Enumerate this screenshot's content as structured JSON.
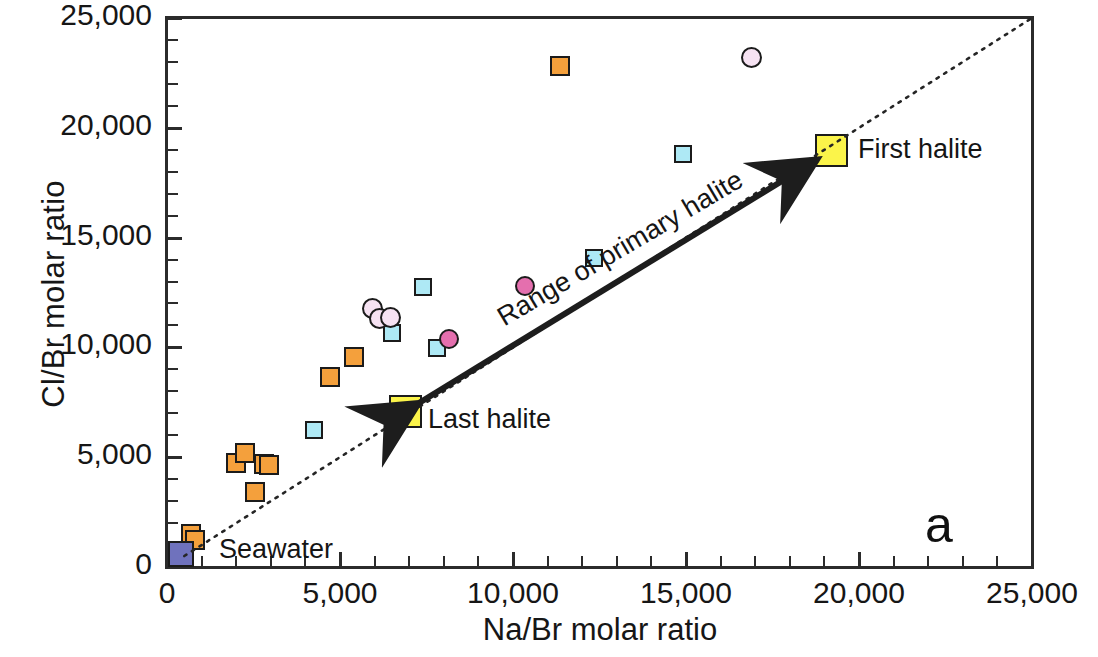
{
  "chart_data": {
    "type": "scatter",
    "title": "",
    "panel_label": "a",
    "xlabel": "Na/Br molar ratio",
    "ylabel": "Cl/Br molar ratio",
    "xlim": [
      0,
      25000
    ],
    "ylim": [
      0,
      25000
    ],
    "xticks": [
      "0",
      "5,000",
      "10,000",
      "15,000",
      "20,000",
      "25,000"
    ],
    "xtick_values": [
      0,
      5000,
      10000,
      15000,
      20000,
      25000
    ],
    "yticks": [
      "0",
      "5,000",
      "10,000",
      "15,000",
      "20,000",
      "25,000"
    ],
    "ytick_values": [
      0,
      5000,
      10000,
      15000,
      20000,
      25000
    ],
    "minor_tick_interval": 1000,
    "grid": false,
    "legend": null,
    "series": [
      {
        "name": "orange-square",
        "marker": "square",
        "fill": "#f4a03c",
        "edge": "#b5732a",
        "size": 20,
        "points": [
          {
            "x": 700,
            "y": 1500
          },
          {
            "x": 800,
            "y": 1250
          },
          {
            "x": 2000,
            "y": 4750
          },
          {
            "x": 2250,
            "y": 5200
          },
          {
            "x": 2800,
            "y": 4700
          },
          {
            "x": 2950,
            "y": 4650
          },
          {
            "x": 2550,
            "y": 3400
          },
          {
            "x": 4700,
            "y": 8650
          },
          {
            "x": 5400,
            "y": 9550
          },
          {
            "x": 11350,
            "y": 22800
          }
        ]
      },
      {
        "name": "cyan-square",
        "marker": "square",
        "fill": "#aee9f5",
        "edge": "#3e9fb8",
        "size": 18,
        "points": [
          {
            "x": 4250,
            "y": 6250
          },
          {
            "x": 6500,
            "y": 10650
          },
          {
            "x": 7800,
            "y": 9950
          },
          {
            "x": 7400,
            "y": 12750
          },
          {
            "x": 12350,
            "y": 14050
          },
          {
            "x": 14900,
            "y": 18800
          }
        ]
      },
      {
        "name": "pink-filled-circle",
        "marker": "circle",
        "fill": "#e46fae",
        "edge": "#8d3a63",
        "size": 20,
        "points": [
          {
            "x": 8150,
            "y": 10400
          },
          {
            "x": 10350,
            "y": 12800
          }
        ]
      },
      {
        "name": "pink-open-circle",
        "marker": "circle",
        "fill": "#f6e2f2",
        "edge": "#86687f",
        "size": 21,
        "points": [
          {
            "x": 5950,
            "y": 11750
          },
          {
            "x": 6150,
            "y": 11300
          },
          {
            "x": 6450,
            "y": 11350
          },
          {
            "x": 16900,
            "y": 23200
          }
        ]
      },
      {
        "name": "seawater-square",
        "marker": "square",
        "fill": "#6f72bd",
        "edge": "#2f3070",
        "size": 26,
        "points": [
          {
            "x": 400,
            "y": 600
          }
        ]
      },
      {
        "name": "halite-endmember-square",
        "marker": "square",
        "fill": "#fbf44a",
        "edge": "#2b2b2b",
        "size": 33,
        "points": [
          {
            "x": 6900,
            "y": 7100
          },
          {
            "x": 19200,
            "y": 18950
          }
        ]
      }
    ],
    "annotations": [
      {
        "name": "seawater",
        "text": "Seawater",
        "x": 1500,
        "y": 600
      },
      {
        "name": "last-halite",
        "text": "Last halite",
        "x": 7700,
        "y": 7100
      },
      {
        "name": "first-halite",
        "text": "First halite",
        "x": 20100,
        "y": 18950
      },
      {
        "name": "range-arrow",
        "text": "Range of primary halite",
        "x": 13000,
        "y": 13000
      },
      {
        "name": "panel",
        "text": "a",
        "x": 22000,
        "y": 1800
      }
    ],
    "reference_line": {
      "name": "seawater-evaporation-trend",
      "style": "dotted",
      "from": {
        "x": 500,
        "y": 500
      },
      "to": {
        "x": 25000,
        "y": 25000
      }
    },
    "range_arrow": {
      "name": "range-of-primary-halite",
      "style": "double-headed-solid-arrow",
      "from": {
        "x": 6900,
        "y": 7100
      },
      "to": {
        "x": 19200,
        "y": 18950
      }
    }
  },
  "axes": {
    "x": {
      "label": "Na/Br molar ratio",
      "ticks": [
        "0",
        "5,000",
        "10,000",
        "15,000",
        "20,000",
        "25,000"
      ]
    },
    "y": {
      "label": "Cl/Br molar ratio",
      "ticks": [
        "0",
        "5,000",
        "10,000",
        "15,000",
        "20,000",
        "25,000"
      ]
    }
  },
  "labels": {
    "seawater": "Seawater",
    "last_halite": "Last halite",
    "first_halite": "First halite",
    "range_of_primary_halite": "Range of primary halite",
    "panel": "a"
  },
  "colors": {
    "orange": "#f4a03c",
    "cyan": "#aee9f5",
    "pink_filled": "#e46fae",
    "pink_open": "#f6e2f2",
    "seawater_blue": "#6f72bd",
    "halite_yellow": "#fbf44a",
    "axis": "#2b2b2b"
  }
}
